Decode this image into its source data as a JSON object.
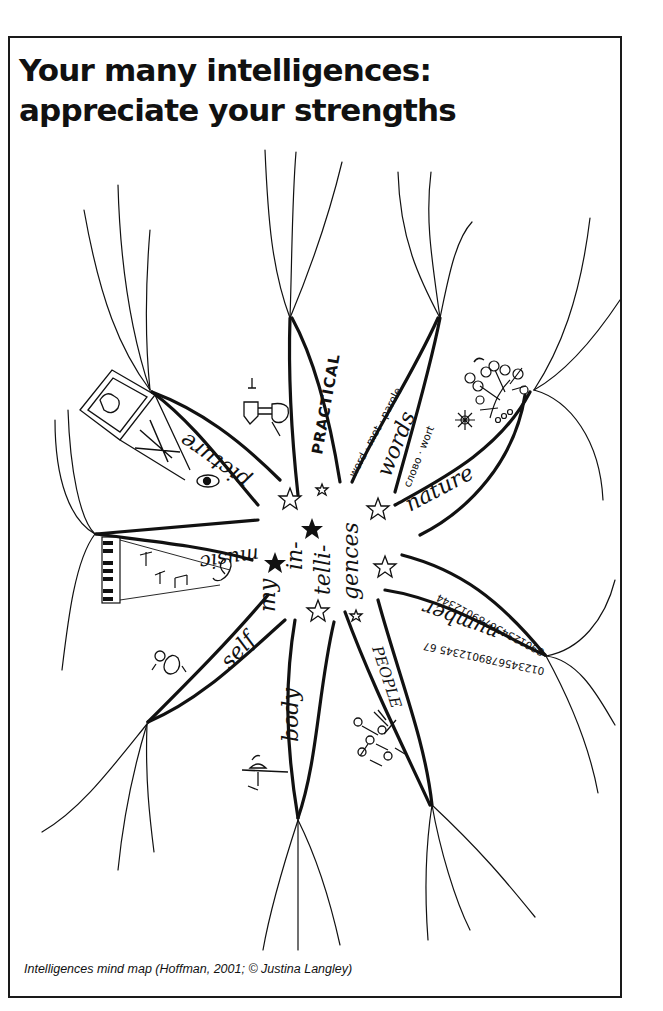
{
  "title": "Your many intelligences: appreciate your strengths",
  "caption": "Intelligences mind map (Hoffman, 2001; © Justina Langley)",
  "center": {
    "lines": [
      "my",
      "in-",
      "telli-",
      "gences"
    ]
  },
  "branches": [
    {
      "id": "picture",
      "label": "picture",
      "icon": "framed-picture-and-pencils-with-eye"
    },
    {
      "id": "practical",
      "label": "PRACTICAL",
      "icon": "hammer-in-hand"
    },
    {
      "id": "words",
      "label": "words",
      "sublabels": [
        "word · mot · parole",
        "слово · wort"
      ]
    },
    {
      "id": "nature",
      "label": "nature",
      "icon": "tree-and-sun"
    },
    {
      "id": "number",
      "label": "number",
      "sublabels": [
        "890123456789012344",
        "0123456789012345 67"
      ]
    },
    {
      "id": "people",
      "label": "PEOPLE",
      "icon": "group-of-people"
    },
    {
      "id": "body",
      "label": "body",
      "icon": "dancer-figure"
    },
    {
      "id": "self",
      "label": "self",
      "icon": "meditating-person"
    },
    {
      "id": "music",
      "label": "music",
      "icon": "piano-keys-and-notes"
    }
  ],
  "colors": {
    "ink": "#111111",
    "paper": "#ffffff"
  }
}
